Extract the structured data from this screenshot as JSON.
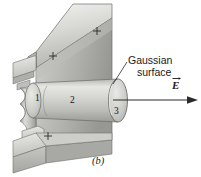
{
  "figure": {
    "panel_label": "(b)",
    "annotations": {
      "gaussian_line1": "Gaussian",
      "gaussian_line2": "surface",
      "field_label": "E"
    },
    "region_numbers": {
      "cap_left": "1",
      "side_wall": "2",
      "cap_right": "3"
    },
    "charge_markers": [
      {
        "name": "plus-sign-top-right",
        "symbol": "+"
      },
      {
        "name": "plus-sign-middle-left",
        "symbol": "+"
      },
      {
        "name": "plus-sign-bottom-left",
        "symbol": "+"
      }
    ],
    "colors": {
      "background": "#ffffff",
      "metal_light": "#e8e8e6",
      "metal_mid": "#c9c9c6",
      "metal_dark": "#a2a29f",
      "metal_darker": "#8b8b88",
      "outline": "#4a4a4a",
      "ink": "#1a1a1a"
    }
  }
}
